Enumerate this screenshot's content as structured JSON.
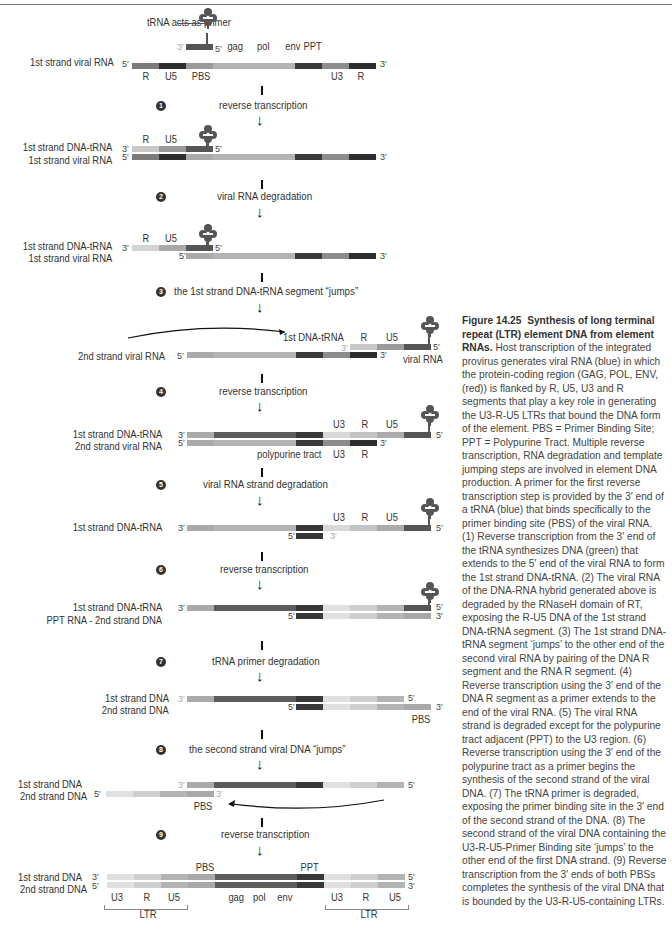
{
  "colors": {
    "R": "#7a7a7a",
    "U5": "#2e2e2e",
    "PBS": "#9a9a9a",
    "coding": "#b4b4b4",
    "PPT": "#3a3a3a",
    "U3": "#8c8c8c",
    "dna_light1": "#d8d8d8",
    "dna_light2": "#c4c4c4",
    "dna_mid": "#ababab",
    "dna_dark": "#5c5c5c",
    "dna_ppt": "#383838",
    "trna": "#555555"
  },
  "labels": {
    "trna_primer": "tRNA acts as primer",
    "first_strand_viral_rna": "1st strand viral RNA",
    "first_strand_dna_trna": "1st strand DNA-tRNA",
    "second_strand_viral_rna": "2nd strand viral RNA",
    "first_dna_trna": "1st DNA-tRNA",
    "viral_rna": "viral RNA",
    "polypurine_tract": "polypurine tract",
    "ppt_rna_second_strand_dna": "PPT RNA - 2nd strand DNA",
    "first_strand_dna": "1st strand DNA",
    "second_strand_dna": "2nd strand DNA"
  },
  "segments": {
    "R": "R",
    "U5": "U5",
    "PBS": "PBS",
    "gag": "gag",
    "pol": "pol",
    "env": "env",
    "PPT": "PPT",
    "U3": "U3",
    "LTR": "LTR"
  },
  "ends": {
    "five": "5′",
    "three": "3′"
  },
  "steps": [
    {
      "num": "1",
      "text": "reverse transcription"
    },
    {
      "num": "2",
      "text": "viral RNA degradation"
    },
    {
      "num": "3",
      "text": "the 1st strand DNA-tRNA segment “jumps”"
    },
    {
      "num": "4",
      "text": "reverse transcription"
    },
    {
      "num": "5",
      "text": "viral RNA strand degradation"
    },
    {
      "num": "6",
      "text": "reverse transcription"
    },
    {
      "num": "7",
      "text": "tRNA primer degradation"
    },
    {
      "num": "8",
      "text": "the second strand viral DNA “jumps”"
    },
    {
      "num": "9",
      "text": "reverse transcription"
    }
  ],
  "caption": {
    "figure_label": "Figure 14.25",
    "title": "Synthesis of long terminal repeat (LTR) element DNA from element RNAs.",
    "body": "Host transcription of the integrated provirus generates viral RNA (blue) in which the protein-coding region (GAG, POL, ENV, (red)) is flanked by R, U5, U3 and R segments that play a key role in generating the U3-R-U5 LTRs that bound the DNA form of the element. PBS = Primer Binding Site; PPT = Polypurine Tract. Multiple reverse transcription, RNA degradation and template jumping steps are involved in element DNA production. A primer for the first reverse transcription step is provided by the 3′ end of a tRNA (blue) that binds specifically to the primer binding site (PBS) of the viral RNA. (1) Reverse transcription from the 3′ end of the tRNA synthesizes DNA (green) that extends to the 5′ end of the viral RNA to form the 1st strand DNA-tRNA. (2) The viral RNA of the DNA-RNA hybrid generated above is degraded by the RNaseH domain of RT, exposing the R-U5 DNA of the 1st strand DNA-tRNA segment. (3) The 1st strand DNA-tRNA segment ‘jumps’ to the other end of the second viral RNA by pairing of the DNA R segment and the RNA R segment. (4) Reverse transcription using the 3′ end of the DNA R segment as a primer extends to the end of the viral RNA. (5) The viral RNA strand is degraded except for the polypurine tract adjacent (PPT) to the U3 region. (6) Reverse transcription using the 3′ end of the polypurine tract as a primer begins the synthesis of the second strand of the viral DNA. (7) The tRNA primer is degraded, exposing the primer binding site in the 3′ end of the second strand of the DNA. (8) The second strand of the viral DNA containing the U3-R-U5-Primer Binding site ‘jumps’ to the other end of the first DNA strand. (9) Reverse transcription from the 3′ ends of both PBSs completes the synthesis of the viral DNA that is bounded by the U3-R-U5-containing LTRs."
  }
}
